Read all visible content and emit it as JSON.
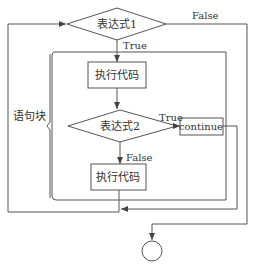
{
  "diagram": {
    "type": "flowchart",
    "nodes": {
      "condition1": {
        "label": "表达式1",
        "shape": "diamond"
      },
      "execute1": {
        "label": "执行代码",
        "shape": "rectangle"
      },
      "condition2": {
        "label": "表达式2",
        "shape": "diamond"
      },
      "continue": {
        "label": "continue",
        "shape": "rectangle"
      },
      "execute2": {
        "label": "执行代码",
        "shape": "rectangle"
      },
      "end": {
        "label": "",
        "shape": "circle"
      }
    },
    "edge_labels": {
      "c1_false": "False",
      "c1_true": "True",
      "c2_true": "True",
      "c2_false": "False"
    },
    "block_label": "语句块",
    "colors": {
      "stroke": "#555555",
      "text": "#333333",
      "background": "#ffffff"
    }
  }
}
